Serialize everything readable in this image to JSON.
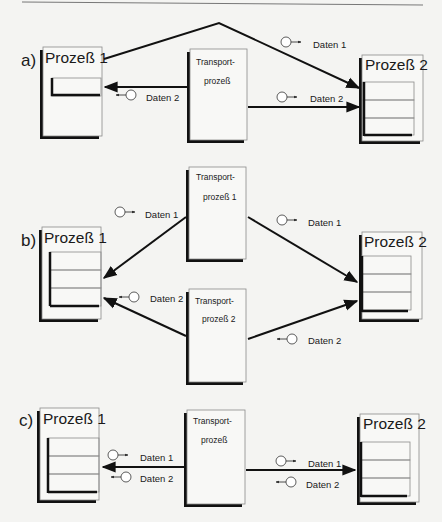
{
  "diagram": {
    "header_rule": true,
    "panels": [
      {
        "id": "a",
        "label": "a)",
        "process1": {
          "title": "Prozeß 1"
        },
        "process2": {
          "title": "Prozeß 2"
        },
        "transports": [
          {
            "line1": "Transport-",
            "line2": "prozeß"
          }
        ],
        "messages": [
          {
            "text": "Daten 1",
            "direction": "right",
            "note": "direct path from Prozeß 1 to Prozeß 2"
          },
          {
            "text": "Daten 2",
            "direction": "left",
            "note": "Transportprozeß to Prozeß 1"
          },
          {
            "text": "Daten 2",
            "direction": "right",
            "note": "Transportprozeß to Prozeß 2"
          }
        ]
      },
      {
        "id": "b",
        "label": "b)",
        "process1": {
          "title": "Prozeß 1"
        },
        "process2": {
          "title": "Prozeß 2"
        },
        "transports": [
          {
            "line1": "Transport-",
            "line2": "prozeß 1"
          },
          {
            "line1": "Transport-",
            "line2": "prozeß 2"
          }
        ],
        "messages": [
          {
            "text": "Daten 1",
            "direction": "right",
            "note": "Transportprozeß 1 to Prozeß 1"
          },
          {
            "text": "Daten 1",
            "direction": "right",
            "note": "Transportprozeß 1 to Prozeß 2"
          },
          {
            "text": "Daten 2",
            "direction": "left",
            "note": "Transportprozeß 2 to Prozeß 1"
          },
          {
            "text": "Daten 2",
            "direction": "left",
            "note": "Transportprozeß 2 to Prozeß 2"
          }
        ]
      },
      {
        "id": "c",
        "label": "c)",
        "process1": {
          "title": "Prozeß 1"
        },
        "process2": {
          "title": "Prozeß 2"
        },
        "transports": [
          {
            "line1": "Transport-",
            "line2": "prozeß"
          }
        ],
        "messages": [
          {
            "text": "Daten 1",
            "direction": "right",
            "note": "left link"
          },
          {
            "text": "Daten 2",
            "direction": "left",
            "note": "left link"
          },
          {
            "text": "Daten 1",
            "direction": "right",
            "note": "right link"
          },
          {
            "text": "Daten 2",
            "direction": "left",
            "note": "right link"
          }
        ]
      }
    ]
  },
  "colors": {
    "background": "#f4f4f2",
    "ink": "#111111",
    "box_fill": "#f8f8f6",
    "box_border": "#8a8a8a",
    "row_line": "#8a8a8a"
  }
}
